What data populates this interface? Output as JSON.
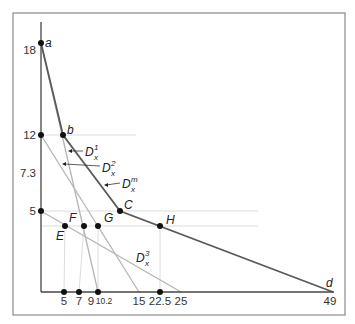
{
  "diagram": {
    "y_ticks": [
      {
        "label": "18",
        "y": 43
      },
      {
        "label": "12",
        "y": 135
      },
      {
        "label": "7.3",
        "y": 173
      },
      {
        "label": "5",
        "y": 211
      }
    ],
    "x_ticks": [
      {
        "label": "5",
        "x": 64
      },
      {
        "label": "7",
        "x": 79
      },
      {
        "label": "9",
        "x": 90
      },
      {
        "label": "10.2",
        "x": 103
      },
      {
        "label": "15",
        "x": 139
      },
      {
        "label": "22.5",
        "x": 160
      },
      {
        "label": "25",
        "x": 181
      },
      {
        "label": "49",
        "x": 330
      }
    ],
    "points": {
      "a": "a",
      "b": "b",
      "C": "C",
      "H": "H",
      "E": "E",
      "F": "F",
      "G": "G",
      "d": "d"
    },
    "curves": {
      "d1": {
        "base": "D",
        "sub": "x",
        "sup": "1"
      },
      "d2": {
        "base": "D",
        "sub": "x",
        "sup": "2"
      },
      "dm": {
        "base": "D",
        "sub": "x",
        "sup": "m"
      },
      "d3": {
        "base": "D",
        "sub": "x",
        "sup": "3"
      }
    },
    "colors": {
      "market_demand": "#5a5a5a",
      "individual_demand": "#b5b5b5",
      "gridline": "#d8d8d8"
    }
  }
}
